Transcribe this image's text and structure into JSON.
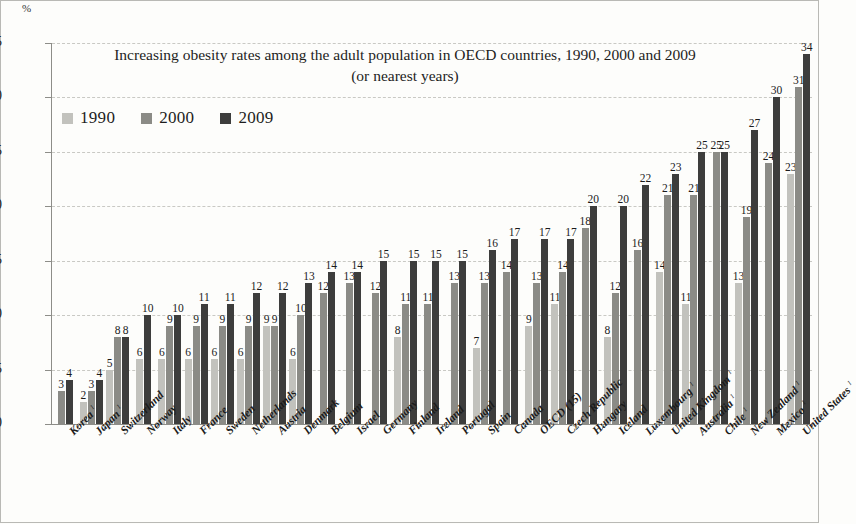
{
  "unit": "%",
  "chart_data": {
    "type": "bar",
    "title": "Increasing obesity rates among the adult population in OECD countries, 1990, 2000 and 2009",
    "subtitle": "(or nearest years)",
    "xlabel": "",
    "ylabel": "%",
    "ylim": [
      0,
      35
    ],
    "ytick_labels": [
      "0",
      "5",
      "10",
      "15",
      "20",
      "25",
      "30",
      "35"
    ],
    "ytick_values": [
      0,
      5,
      10,
      15,
      20,
      25,
      30,
      35
    ],
    "grid": true,
    "legend_position": "top-left",
    "legend": [
      {
        "name": "1990",
        "color": "#c2c2bd"
      },
      {
        "name": "2000",
        "color": "#8b8b86"
      },
      {
        "name": "2009",
        "color": "#3d3d3c"
      }
    ],
    "categories": [
      "Korea",
      "Japan",
      "Switzerland",
      "Norway",
      "Italy",
      "France",
      "Sweden",
      "Netherlands",
      "Austria",
      "Denmark",
      "Belgium",
      "Israel",
      "Germany",
      "Finland",
      "Ireland",
      "Portugal",
      "Spain",
      "Canada",
      "OECD (15)",
      "Czech Republic",
      "Hungary",
      "Iceland",
      "Luxembourg",
      "United Kingdom",
      "Australia",
      "Chile",
      "New Zealand",
      "Mexico",
      "United States"
    ],
    "category_footnotes": [
      "1",
      "1",
      "",
      "",
      "",
      "",
      "",
      "",
      "",
      "",
      "",
      "",
      "",
      "",
      "",
      "",
      "",
      "",
      "",
      "",
      "",
      "",
      "1",
      "1",
      "1",
      "1",
      "1",
      "1",
      "1"
    ],
    "series": [
      {
        "name": "1990",
        "color": "#c2c2bd",
        "values": [
          null,
          2,
          5,
          6,
          6,
          6,
          6,
          6,
          9,
          6,
          null,
          null,
          null,
          8,
          null,
          null,
          7,
          null,
          9,
          11,
          null,
          8,
          null,
          14,
          11,
          null,
          13,
          null,
          23
        ]
      },
      {
        "name": "2000",
        "color": "#8b8b86",
        "values": [
          3,
          3,
          8,
          null,
          9,
          9,
          9,
          9,
          9,
          10,
          12,
          13,
          12,
          11,
          11,
          13,
          13,
          14,
          13,
          14,
          18,
          12,
          16,
          21,
          21,
          25,
          19,
          24,
          31
        ]
      },
      {
        "name": "2009",
        "color": "#3d3d3c",
        "values": [
          4,
          4,
          8,
          10,
          10,
          11,
          11,
          12,
          12,
          13,
          14,
          14,
          15,
          15,
          15,
          15,
          16,
          17,
          17,
          17,
          20,
          20,
          22,
          23,
          25,
          25,
          27,
          30,
          34
        ]
      }
    ]
  }
}
